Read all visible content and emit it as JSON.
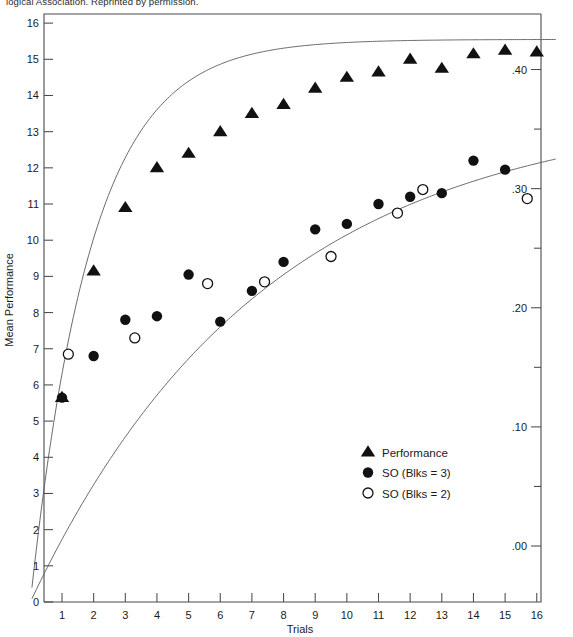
{
  "caption": {
    "top_text": "logical Association. Reprinted by permission."
  },
  "chart_data": {
    "type": "scatter",
    "title": "",
    "xlabel": "Trials",
    "ylabel": "Mean Performance",
    "y2label": "",
    "xlim": [
      0,
      16.8
    ],
    "ylim": [
      0,
      16
    ],
    "y2lim": [
      -0.047,
      0.4466
    ],
    "grid": false,
    "legend_position": "inside-bottom-center",
    "xticks": [
      1,
      2,
      3,
      4,
      5,
      6,
      7,
      8,
      9,
      10,
      11,
      12,
      13,
      14,
      15,
      16
    ],
    "xticklabels": [
      "1",
      "2",
      "3",
      "4",
      "5",
      "6",
      "7",
      "8",
      "9",
      "10",
      "11",
      "12",
      "13",
      "14",
      "15",
      "16"
    ],
    "yticks": [
      0,
      1,
      2,
      3,
      4,
      5,
      6,
      7,
      8,
      9,
      10,
      11,
      12,
      13,
      14,
      15,
      16
    ],
    "yticklabels": [
      "0",
      "1",
      "2",
      "3",
      "4",
      "5",
      "6",
      "7",
      "8",
      "9",
      "10",
      "11",
      "12",
      "13",
      "14",
      "15",
      "16"
    ],
    "y2ticks": [
      0.0,
      0.05,
      0.1,
      0.15,
      0.2,
      0.25,
      0.3,
      0.35,
      0.4
    ],
    "y2ticklabels_major": [
      ".00",
      ".10",
      ".20",
      ".30",
      ".40"
    ],
    "y2ticks_major": [
      0.0,
      0.1,
      0.2,
      0.3,
      0.4
    ],
    "series": [
      {
        "name": "Performance",
        "marker": "filled-triangle",
        "axis": "left",
        "points": [
          {
            "x": 1,
            "y": 5.65
          },
          {
            "x": 2,
            "y": 9.15
          },
          {
            "x": 3,
            "y": 10.9
          },
          {
            "x": 4,
            "y": 12.0
          },
          {
            "x": 5,
            "y": 12.4
          },
          {
            "x": 6,
            "y": 13.0
          },
          {
            "x": 7,
            "y": 13.5
          },
          {
            "x": 8,
            "y": 13.75
          },
          {
            "x": 9,
            "y": 14.2
          },
          {
            "x": 10,
            "y": 14.5
          },
          {
            "x": 11,
            "y": 14.65
          },
          {
            "x": 12,
            "y": 15.0
          },
          {
            "x": 13,
            "y": 14.75
          },
          {
            "x": 14,
            "y": 15.15
          },
          {
            "x": 15,
            "y": 15.25
          },
          {
            "x": 16,
            "y": 15.2
          }
        ],
        "fit_curve": {
          "model": "asymptotic",
          "asymptote": 15.55,
          "rate": 0.52,
          "x_start": 0.05,
          "x_end": 16.6
        }
      },
      {
        "name": "SO (Blks = 3)",
        "marker": "filled-circle",
        "axis": "right",
        "points": [
          {
            "x": 1,
            "y": 5.65
          },
          {
            "x": 2,
            "y": 6.8
          },
          {
            "x": 3,
            "y": 7.8
          },
          {
            "x": 4,
            "y": 7.9
          },
          {
            "x": 5,
            "y": 9.05
          },
          {
            "x": 6,
            "y": 7.75
          },
          {
            "x": 7,
            "y": 8.6
          },
          {
            "x": 8,
            "y": 9.4
          },
          {
            "x": 9,
            "y": 10.3
          },
          {
            "x": 10,
            "y": 10.45
          },
          {
            "x": 11,
            "y": 11.0
          },
          {
            "x": 12,
            "y": 11.2
          },
          {
            "x": 13,
            "y": 11.3
          },
          {
            "x": 14,
            "y": 12.2
          },
          {
            "x": 15,
            "y": 11.95
          }
        ]
      },
      {
        "name": "SO (Blks = 2)",
        "marker": "open-circle",
        "axis": "right",
        "points": [
          {
            "x": 1.2,
            "y": 6.85
          },
          {
            "x": 3.3,
            "y": 7.3
          },
          {
            "x": 5.6,
            "y": 8.8
          },
          {
            "x": 7.4,
            "y": 8.85
          },
          {
            "x": 9.5,
            "y": 9.55
          },
          {
            "x": 11.6,
            "y": 10.75
          },
          {
            "x": 12.4,
            "y": 11.4
          },
          {
            "x": 15.7,
            "y": 11.15
          }
        ]
      }
    ],
    "so_fit_curve": {
      "model": "asymptotic",
      "asymptote": 13.7,
      "rate": 0.135,
      "x_start": 0.05,
      "x_end": 16.6
    },
    "legend_entries": [
      {
        "label": "Performance",
        "marker": "filled-triangle"
      },
      {
        "label": "SO (Blks = 3)",
        "marker": "filled-circle"
      },
      {
        "label": "SO (Blks = 2)",
        "marker": "open-circle"
      }
    ]
  }
}
